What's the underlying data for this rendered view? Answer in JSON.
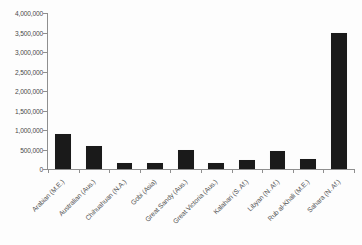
{
  "chart_data": {
    "type": "bar",
    "title": "",
    "xlabel": "",
    "ylabel": "",
    "ylim": [
      0,
      4000000
    ],
    "grid": false,
    "legend": "none",
    "orientation": "vertical",
    "bar_color": "#1a1a1a",
    "axis_color": "#8f8f8f",
    "background_color": "#fdfdfd",
    "categories": [
      "Arabian (M.E.)",
      "Australian (Aus.)",
      "Chihuahuan (N.A.)",
      "Gobi (Asia)",
      "Great Sandy (Aus.)",
      "Great Victoria (Aus.)",
      "Kalahari (S. Af.)",
      "Libyan (N. Af.)",
      "Rub al-Khali (M.E.)",
      "Sahara (N. Af.)"
    ],
    "values": [
      900000,
      600000,
      150000,
      150000,
      500000,
      150000,
      220000,
      450000,
      250000,
      3500000
    ],
    "ytick_values": [
      0,
      500000,
      1000000,
      1500000,
      2000000,
      2500000,
      3000000,
      3500000,
      4000000
    ],
    "ytick_labels": [
      "0",
      "500,000",
      "1,000,000",
      "1,500,000",
      "2,000,000",
      "2,500,000",
      "3,000,000",
      "3,500,000",
      "4,000,000"
    ]
  }
}
